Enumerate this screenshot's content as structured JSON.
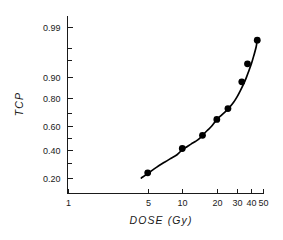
{
  "chart_data": {
    "type": "line",
    "title": "",
    "subtitle": "",
    "xlabel": "DOSE (Gy)",
    "ylabel": "TCP",
    "xscale": "log",
    "yscale": "probit",
    "xlim": [
      1,
      50
    ],
    "ylim": [
      0.12,
      0.995
    ],
    "grid": false,
    "legend": null,
    "x_ticks": [
      {
        "value": 1,
        "label": "1"
      },
      {
        "value": 5,
        "label": "5"
      },
      {
        "value": 10,
        "label": "10"
      },
      {
        "value": 20,
        "label": "20"
      },
      {
        "value": 30,
        "label": "30"
      },
      {
        "value": 40,
        "label": "40"
      },
      {
        "value": 50,
        "label": "50"
      }
    ],
    "y_ticks": [
      {
        "value": 0.2,
        "label": "0.20"
      },
      {
        "value": 0.4,
        "label": "0.40"
      },
      {
        "value": 0.6,
        "label": "0.60"
      },
      {
        "value": 0.8,
        "label": "0.80"
      },
      {
        "value": 0.9,
        "label": "0.90"
      },
      {
        "value": 0.99,
        "label": "0.99"
      }
    ],
    "y_minor_ticks": [
      0.3,
      0.5,
      0.7,
      0.95,
      0.97
    ],
    "series": [
      {
        "name": "TCP",
        "marker": "filled-circle",
        "x": [
          5.0,
          10.0,
          15.0,
          20.0,
          25.0,
          33.0,
          37.0,
          45.0
        ],
        "y": [
          0.23,
          0.41,
          0.52,
          0.65,
          0.73,
          0.88,
          0.94,
          0.98
        ]
      }
    ],
    "fit_curve": {
      "name": "sigmoid fit",
      "x": [
        4.4,
        5.0,
        6.0,
        7.0,
        8.0,
        9.0,
        10.0,
        11.0,
        12.0,
        13.0,
        14.0,
        15.0,
        16.5,
        18.0,
        20.0,
        22.0,
        24.0,
        26.0,
        28.0,
        30.0,
        32.0,
        34.0,
        36.0,
        38.0,
        40.0,
        42.0,
        44.0,
        45.0
      ],
      "y": [
        0.198,
        0.225,
        0.268,
        0.303,
        0.333,
        0.36,
        0.4,
        0.425,
        0.448,
        0.468,
        0.49,
        0.52,
        0.56,
        0.595,
        0.648,
        0.683,
        0.712,
        0.742,
        0.772,
        0.805,
        0.838,
        0.868,
        0.895,
        0.92,
        0.94,
        0.958,
        0.972,
        0.98
      ]
    },
    "colors": {
      "axis": "#1a1a1a",
      "curve": "#000000",
      "marker": "#000000",
      "background": "#ffffff"
    }
  },
  "figure": {
    "xaxis_title": "DOSE (Gy)",
    "yaxis_title": "TCP"
  }
}
